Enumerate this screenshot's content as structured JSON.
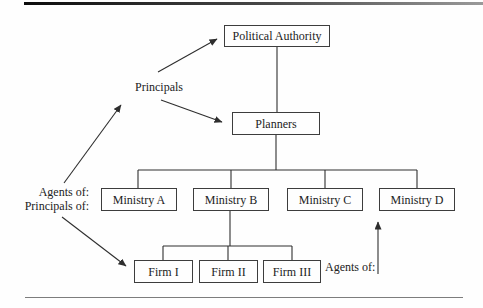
{
  "figure": {
    "type": "hierarchy-diagram",
    "background_color": "#fefefe",
    "line_color": "#2e2e2e",
    "box_border_color": "#3d3d3d",
    "text_color": "#222222"
  },
  "nodes": {
    "political_authority": {
      "label": "Political Authority"
    },
    "planners": {
      "label": "Planners"
    },
    "ministry_a": {
      "label": "Ministry A"
    },
    "ministry_b": {
      "label": "Ministry B"
    },
    "ministry_c": {
      "label": "Ministry C"
    },
    "ministry_d": {
      "label": "Ministry D"
    },
    "firm_1": {
      "label": "Firm I"
    },
    "firm_2": {
      "label": "Firm II"
    },
    "firm_3": {
      "label": "Firm III"
    }
  },
  "annotations": {
    "principals": "Principals",
    "agents_of_left": "Agents of:",
    "principals_of_left": "Principals of:",
    "agents_of_right": "Agents of:"
  }
}
